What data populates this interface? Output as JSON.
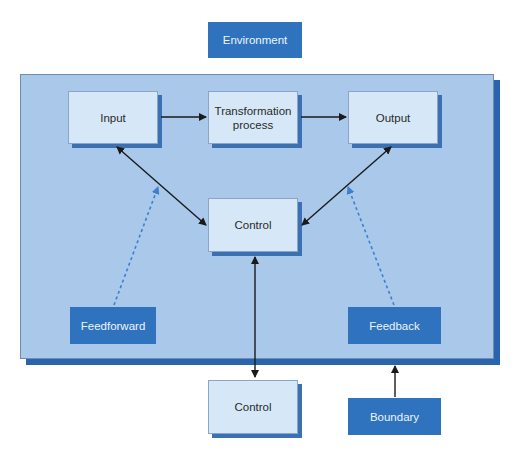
{
  "diagram": {
    "environment_label": "Environment",
    "nodes": {
      "input": "Input",
      "transformation": "Transformation process",
      "output": "Output",
      "control_inner": "Control",
      "feedforward": "Feedforward",
      "feedback": "Feedback",
      "control_outer": "Control",
      "boundary": "Boundary"
    },
    "edges": [
      {
        "from": "input",
        "to": "transformation",
        "style": "solid",
        "direction": "forward"
      },
      {
        "from": "transformation",
        "to": "output",
        "style": "solid",
        "direction": "forward"
      },
      {
        "from": "control_inner",
        "to": "input",
        "style": "solid",
        "direction": "both"
      },
      {
        "from": "control_inner",
        "to": "output",
        "style": "solid",
        "direction": "both"
      },
      {
        "from": "feedforward",
        "to": "input",
        "style": "dashed",
        "direction": "forward"
      },
      {
        "from": "feedback",
        "to": "output",
        "style": "dashed",
        "direction": "forward"
      },
      {
        "from": "control_inner",
        "to": "control_outer",
        "style": "solid",
        "direction": "both"
      },
      {
        "from": "boundary",
        "to": "panel-edge",
        "style": "solid",
        "direction": "forward"
      }
    ],
    "colors": {
      "dark_blue": "#2f73bf",
      "panel_fill": "#a9c8ea",
      "pale_box": "#d6e8f8",
      "shadow": "#2a64ad",
      "dashed_arrow": "#3d7fd0"
    }
  }
}
